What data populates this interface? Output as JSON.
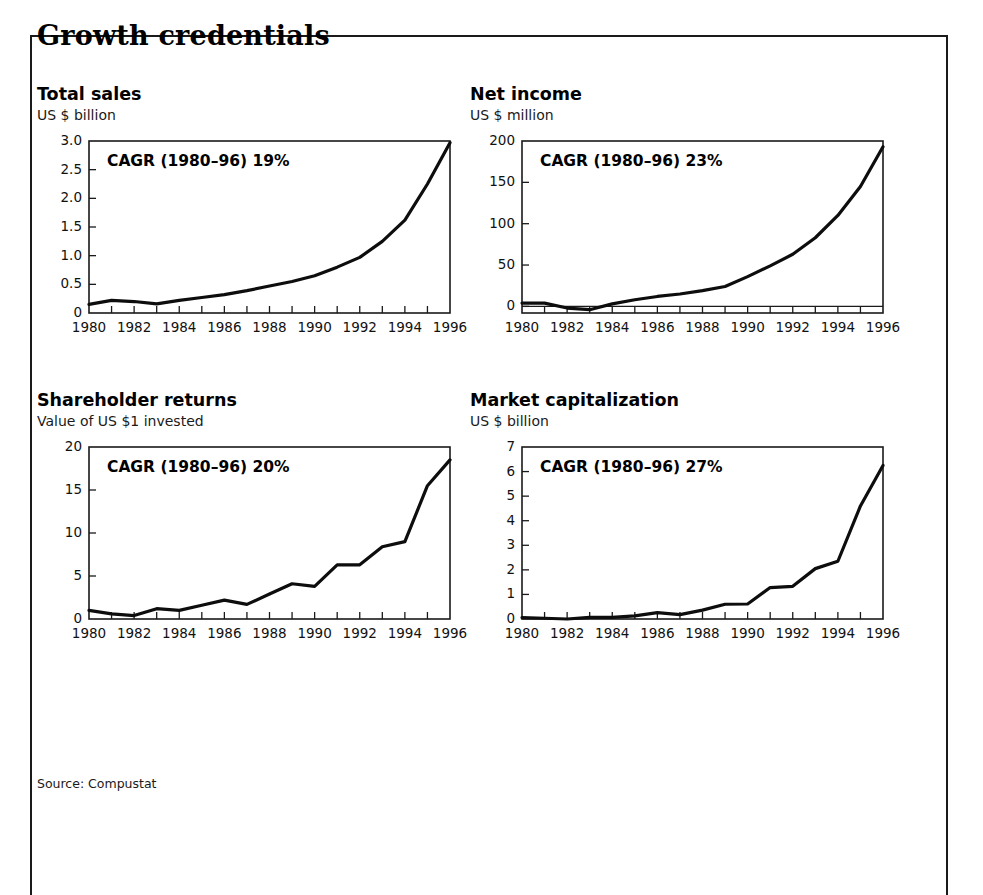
{
  "exhibit": {
    "title": "Growth credentials",
    "source_note": "Source: Compustat",
    "border_color": "#1a1a1a",
    "line_color": "#0d0d0d",
    "background": "#ffffff"
  },
  "chart_data": [
    {
      "id": "total-sales",
      "type": "line",
      "title": "Total sales",
      "subtitle": "US $ billion",
      "ylabel": "US $ billion",
      "xlabel": "",
      "annotation": "CAGR (1980–96) 19%",
      "cagr_period": "1980–96",
      "cagr_value": "19%",
      "ylim": [
        0,
        3.0
      ],
      "yticks": [
        0,
        0.5,
        1.0,
        1.5,
        2.0,
        2.5,
        3.0
      ],
      "ytick_labels": [
        "0",
        "0.5",
        "1.0",
        "1.5",
        "2.0",
        "2.5",
        "3.0"
      ],
      "xlim": [
        1980,
        1996
      ],
      "xticks": [
        1980,
        1981,
        1982,
        1983,
        1984,
        1985,
        1986,
        1987,
        1988,
        1989,
        1990,
        1991,
        1992,
        1993,
        1994,
        1995,
        1996
      ],
      "xtick_labels": [
        "1980",
        "1982",
        "1984",
        "1986",
        "1988",
        "1990",
        "1992",
        "1994",
        "1996"
      ],
      "xtick_labels_years": [
        1980,
        1982,
        1984,
        1986,
        1988,
        1990,
        1992,
        1994,
        1996
      ],
      "x": [
        1980,
        1981,
        1982,
        1983,
        1984,
        1985,
        1986,
        1987,
        1988,
        1989,
        1990,
        1991,
        1992,
        1993,
        1994,
        1995,
        1996
      ],
      "values": [
        0.15,
        0.22,
        0.2,
        0.16,
        0.22,
        0.27,
        0.32,
        0.39,
        0.47,
        0.55,
        0.65,
        0.8,
        0.97,
        1.25,
        1.62,
        2.25,
        2.97
      ],
      "grid": false,
      "legend": "none"
    },
    {
      "id": "net-income",
      "type": "line",
      "title": "Net income",
      "subtitle": "US $ million",
      "ylabel": "US $ million",
      "xlabel": "",
      "annotation": "CAGR (1980–96) 23%",
      "cagr_period": "1980–96",
      "cagr_value": "23%",
      "ylim": [
        -8,
        200
      ],
      "yticks": [
        0,
        50,
        100,
        150,
        200
      ],
      "ytick_labels": [
        "0",
        "50",
        "100",
        "150",
        "200"
      ],
      "xlim": [
        1980,
        1996
      ],
      "xticks": [
        1980,
        1981,
        1982,
        1983,
        1984,
        1985,
        1986,
        1987,
        1988,
        1989,
        1990,
        1991,
        1992,
        1993,
        1994,
        1995,
        1996
      ],
      "xtick_labels": [
        "1980",
        "1982",
        "1984",
        "1986",
        "1988",
        "1990",
        "1992",
        "1994",
        "1996"
      ],
      "xtick_labels_years": [
        1980,
        1982,
        1984,
        1986,
        1988,
        1990,
        1992,
        1994,
        1996
      ],
      "x": [
        1980,
        1981,
        1982,
        1983,
        1984,
        1985,
        1986,
        1987,
        1988,
        1989,
        1990,
        1991,
        1992,
        1993,
        1994,
        1995,
        1996
      ],
      "values": [
        4,
        4,
        -2,
        -4,
        3,
        8,
        12,
        15,
        19,
        24,
        36,
        49,
        63,
        83,
        110,
        145,
        193
      ],
      "grid": false,
      "legend": "none"
    },
    {
      "id": "shareholder-returns",
      "type": "line",
      "title": "Shareholder returns",
      "subtitle": "Value of US $1 invested",
      "ylabel": "Value of US $1 invested",
      "xlabel": "",
      "annotation": "CAGR (1980–96) 20%",
      "cagr_period": "1980–96",
      "cagr_value": "20%",
      "ylim": [
        0,
        20
      ],
      "yticks": [
        0,
        5,
        10,
        15,
        20
      ],
      "ytick_labels": [
        "0",
        "5",
        "10",
        "15",
        "20"
      ],
      "xlim": [
        1980,
        1996
      ],
      "xticks": [
        1980,
        1981,
        1982,
        1983,
        1984,
        1985,
        1986,
        1987,
        1988,
        1989,
        1990,
        1991,
        1992,
        1993,
        1994,
        1995,
        1996
      ],
      "xtick_labels": [
        "1980",
        "1982",
        "1984",
        "1986",
        "1988",
        "1990",
        "1992",
        "1994",
        "1996"
      ],
      "xtick_labels_years": [
        1980,
        1982,
        1984,
        1986,
        1988,
        1990,
        1992,
        1994,
        1996
      ],
      "x": [
        1980,
        1981,
        1982,
        1983,
        1984,
        1985,
        1986,
        1987,
        1988,
        1989,
        1990,
        1991,
        1992,
        1993,
        1994,
        1995,
        1996
      ],
      "values": [
        1.0,
        0.6,
        0.4,
        1.2,
        1.0,
        1.6,
        2.2,
        1.7,
        2.9,
        4.1,
        3.8,
        6.3,
        6.3,
        8.4,
        9.0,
        15.5,
        18.5
      ],
      "grid": false,
      "legend": "none"
    },
    {
      "id": "market-capitalization",
      "type": "line",
      "title": "Market capitalization",
      "subtitle": "US $ billion",
      "ylabel": "US $ billion",
      "xlabel": "",
      "annotation": "CAGR (1980–96) 27%",
      "cagr_period": "1980–96",
      "cagr_value": "27%",
      "ylim": [
        0,
        7
      ],
      "yticks": [
        0,
        1,
        2,
        3,
        4,
        5,
        6,
        7
      ],
      "ytick_labels": [
        "0",
        "1",
        "2",
        "3",
        "4",
        "5",
        "6",
        "7"
      ],
      "xlim": [
        1980,
        1996
      ],
      "xticks": [
        1980,
        1981,
        1982,
        1983,
        1984,
        1985,
        1986,
        1987,
        1988,
        1989,
        1990,
        1991,
        1992,
        1993,
        1994,
        1995,
        1996
      ],
      "xtick_labels": [
        "1980",
        "1982",
        "1984",
        "1986",
        "1988",
        "1990",
        "1992",
        "1994",
        "1996"
      ],
      "xtick_labels_years": [
        1980,
        1982,
        1984,
        1986,
        1988,
        1990,
        1992,
        1994,
        1996
      ],
      "x": [
        1980,
        1981,
        1982,
        1983,
        1984,
        1985,
        1986,
        1987,
        1988,
        1989,
        1990,
        1991,
        1992,
        1993,
        1994,
        1995,
        1996
      ],
      "values": [
        0.06,
        0.03,
        0.0,
        0.07,
        0.07,
        0.13,
        0.26,
        0.18,
        0.36,
        0.6,
        0.61,
        1.28,
        1.33,
        2.05,
        2.35,
        4.6,
        6.25
      ],
      "grid": false,
      "legend": "none"
    }
  ]
}
